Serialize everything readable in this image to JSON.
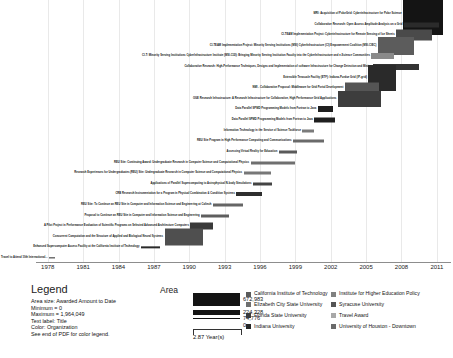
{
  "chart_data": {
    "type": "bar",
    "subtype": "gantt-timeline",
    "title": "",
    "xlabel": "",
    "ylabel": "",
    "xlim": [
      1977.0,
      2012.2
    ],
    "grid": true,
    "tick_labels": [
      "1978",
      "1981",
      "1984",
      "1987",
      "1990",
      "1993",
      "1996",
      "1999",
      "2002",
      "2005",
      "2008",
      "2011"
    ],
    "tick_values": [
      1978,
      1981,
      1984,
      1987,
      1990,
      1993,
      1996,
      1999,
      2002,
      2005,
      2008,
      2011
    ],
    "legend_position": "bottom",
    "bars": [
      {
        "title": "MRI: Acquisition of PolarGrid: Cyberinfrastructure for Polar Science",
        "start": 2008.15,
        "end": 2011.55,
        "thickness": 42,
        "color": "#141414"
      },
      {
        "title": "Collaborative Research:  Open Access Amplitude Analysis on a Grid",
        "start": 2008.2,
        "end": 2011.2,
        "thickness": 5,
        "color": "#2b2b2b"
      },
      {
        "title": "CI-TEAM Implementation Project: Cyberinfrastructure for Remote Sensing of Ice Sheets",
        "start": 2007.55,
        "end": 2010.6,
        "thickness": 11,
        "color": "#4a4a4a"
      },
      {
        "title": "CI-TEAM Implementation Project: Minority Serving Institutions (MSI) CyberInfrastructure (CI) Empowerment Coalition (MSI-CIEC)",
        "start": 2006.0,
        "end": 2009.1,
        "thickness": 18,
        "color": "#5c5c5c"
      },
      {
        "title": "CI-T: Minority Serving Institutions CyberInfrastructure Institute (MSI-CI2I):  Bringing Minority Serving Institution Faculty into the CyberInfrastructure and e-Science Communities",
        "start": 2005.45,
        "end": 2007.4,
        "thickness": 6,
        "color": "#8a8a8a"
      },
      {
        "title": "Collaborative Research: High-Performance Techniques, Designs and Implementation of software Infrastructure for Change Detection and Mining",
        "start": 2005.6,
        "end": 2009.5,
        "thickness": 6,
        "color": "#333333"
      },
      {
        "title": "Extensible Terascale Facility (ETF):  Indiana-Purdue Grid (IP-grid)",
        "start": 2005.2,
        "end": 2007.5,
        "thickness": 26,
        "color": "#2a2a2a"
      },
      {
        "title": "NMI - Collaborative Proposal: Middleware for Grid Portal Development",
        "start": 2003.2,
        "end": 2006.1,
        "thickness": 11,
        "color": "#555555"
      },
      {
        "title": "OGE Research Infrastructure:  A Research Infrastructure for Collaborative, High Performance Grid Applications",
        "start": 2002.6,
        "end": 2006.3,
        "thickness": 16,
        "color": "#3d3d3d"
      },
      {
        "title": "Data Parallel SPMD Programming Models from Fortran to Java",
        "start": 2000.9,
        "end": 2002.2,
        "thickness": 6,
        "color": "#1f1f1f"
      },
      {
        "title": "Data Parallel SPMD Programming Models from Fortran to Java",
        "start": 2000.6,
        "end": 2002.4,
        "thickness": 5,
        "color": "#1f1f1f"
      },
      {
        "title": "Information Technology in the Service of Science Taskforce",
        "start": 1999.6,
        "end": 2000.6,
        "thickness": 3,
        "color": "#7b7b7b"
      },
      {
        "title": "REU Site Program in High Performance Computing and Communications",
        "start": 1998.8,
        "end": 2001.4,
        "thickness": 3,
        "color": "#6a6a6a"
      },
      {
        "title": "Assessing Virtual Reality for Education",
        "start": 1997.6,
        "end": 1999.1,
        "thickness": 3,
        "color": "#5a5a5a"
      },
      {
        "title": "REU Site: Continuing Award:  Undergraduate Research in Computer Science and Computational Physics",
        "start": 1995.2,
        "end": 1999.0,
        "thickness": 3,
        "color": "#6f6f6f"
      },
      {
        "title": "Research Experiences for Undergraduates (REU) Site:  Undergraduate Research in Computer Science and Computational Physics",
        "start": 1994.6,
        "end": 1996.9,
        "thickness": 3,
        "color": "#777777"
      },
      {
        "title": "Applications of Parallel Supercomputing to Astrophysical N-body Simulations",
        "start": 1995.4,
        "end": 1997.0,
        "thickness": 3,
        "color": "#444444"
      },
      {
        "title": "CRB Research Instrumentation for a Program in Physical Combination & Condition Systems",
        "start": 1994.0,
        "end": 1996.2,
        "thickness": 4,
        "color": "#2e2e2e"
      },
      {
        "title": "REU Site:  To Continue an REU Site in Computer and Information Science and Engineering at Caltech",
        "start": 1992.0,
        "end": 1994.6,
        "thickness": 3,
        "color": "#656565"
      },
      {
        "title": "Proposal to Continue an REU Site in Computer and Information Science and Engineering",
        "start": 1991.0,
        "end": 1993.4,
        "thickness": 3,
        "color": "#5e5e5e"
      },
      {
        "title": "A Pilot Project in Performance Evaluation of Scientific Programs on Selected Advanced Architecture Computers",
        "start": 1990.1,
        "end": 1992.0,
        "thickness": 7,
        "color": "#3a3a3a"
      },
      {
        "title": "Concurrent Computation and the Structure of Applied and      Biological Neural Systems",
        "start": 1987.9,
        "end": 1991.2,
        "thickness": 17,
        "color": "#4f4f4f"
      },
      {
        "title": "Enhanced Supercomputer Access Facility at the California     Institute of Technology",
        "start": 1985.9,
        "end": 1987.5,
        "thickness": 1.3,
        "color": "#2a2a2a"
      },
      {
        "title": "Travel to Attend  10th International...",
        "start": 1978.1,
        "end": 1978.6,
        "thickness": 1.3,
        "color": "#2a2a2a"
      }
    ]
  },
  "legend": {
    "heading": "Legend",
    "lines": [
      "Area size: Awarded Amount to Date",
      "Minimum = 0",
      "Maximum = 1,964,049",
      "Text label: Title",
      "Color: Organization",
      "See end of PDF for color legend."
    ],
    "area_heading": "Area",
    "area_values": [
      "672,983",
      "224,328",
      "74,776",
      "0"
    ],
    "year_scale_label": "2.87 Year(s)",
    "organizations_left": [
      {
        "name": "California Institute of Technology",
        "color": "#5a5a5a"
      },
      {
        "name": "Elizabeth City State University",
        "color": "#6e6e6e"
      },
      {
        "name": "Florida State University",
        "color": "#3b3b3b"
      },
      {
        "name": "Indiana University",
        "color": "#262626"
      }
    ],
    "organizations_right": [
      {
        "name": "Institute for Higher Education Policy",
        "color": "#818181"
      },
      {
        "name": "Syracuse University",
        "color": "#555555"
      },
      {
        "name": "Travel Award",
        "color": "#a8a8a8"
      },
      {
        "name": "University of Houston - Downtown",
        "color": "#6a6a6a"
      }
    ]
  }
}
